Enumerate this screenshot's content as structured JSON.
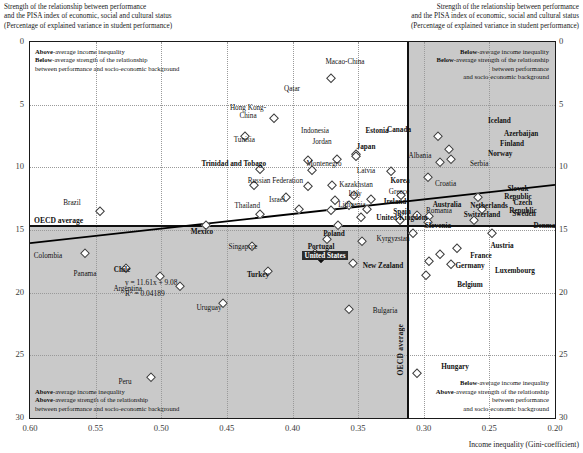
{
  "axis_titles": {
    "left": "Strength of the relationship between performance\nand the PISA index of economic, social and cultural status\n(Percentage of explained variance in student performance)",
    "right": "Strength of the relationship between performance\nand the PISA index of economic, social and cultural status\n(Percentage of explained variance in student performance)",
    "x": "Income inequality (Gini-coefficient)"
  },
  "notes": {
    "top_left": "Above-average income inequality\nBelow-average strength of the relationship\nbetween performance and socio-economic background",
    "bottom_left": "Above-average income inequality\nAbove-average strength of the relationship\nbetween performance and socio-economic background",
    "top_right": "Below-average income inequality\nBelow-average strength of the relationship\nbetween performance\nand socio-economic background",
    "bottom_right": "Below-average income inequality\nAbove-average strength of the relationship\nbetween performance\nand socio-economic background"
  },
  "oecd": {
    "horizontal_label": "OECD average",
    "vertical_label": "OECD average",
    "horizontal_value": 14.6,
    "vertical_value": 0.313
  },
  "regression": {
    "equation": "y = 11.61x + 9.08",
    "r2_label": "R",
    "r2_exp": "2",
    "r2_value": " = 0.04189",
    "slope": 11.61,
    "intercept": 9.08,
    "r2": 0.04189
  },
  "chart_data": {
    "type": "scatter",
    "title": "",
    "xlabel": "Income inequality (Gini-coefficient)",
    "ylabel": "Strength of the relationship between performance and the PISA index of economic, social and cultural status (Percentage of explained variance in student performance)",
    "xlim": [
      0.6,
      0.2
    ],
    "ylim": [
      0,
      30
    ],
    "x_reversed": true,
    "y_reversed": true,
    "xticks": [
      "0.60",
      "0.55",
      "0.50",
      "0.45",
      "0.40",
      "0.35",
      "0.30",
      "0.25",
      "0.20"
    ],
    "yticks": [
      "0",
      "5",
      "10",
      "15",
      "20",
      "25",
      "30"
    ],
    "grid": true,
    "legend": "none",
    "trendline": {
      "slope": 11.61,
      "intercept": 9.08,
      "r2": 0.04189
    },
    "points": [
      {
        "name": "Macao-China",
        "x": 0.371,
        "y": 2.9,
        "lx": 345,
        "ly": 58,
        "align": "c",
        "bold": false
      },
      {
        "name": "Qatar",
        "x": 0.414,
        "y": 6.1,
        "lx": 292,
        "ly": 85,
        "align": "c",
        "bold": false
      },
      {
        "name": "Hong Kong-\nChina",
        "x": 0.436,
        "y": 7.5,
        "lx": 248,
        "ly": 104,
        "align": "c",
        "bold": false
      },
      {
        "name": "Iceland",
        "x": 0.289,
        "y": 7.5,
        "lx": 488,
        "ly": 117,
        "align": "l",
        "bold": true
      },
      {
        "name": "Indonesia",
        "x": 0.388,
        "y": 9.4,
        "lx": 315,
        "ly": 127,
        "align": "c",
        "bold": false
      },
      {
        "name": "Estonia",
        "x": 0.366,
        "y": 9.3,
        "lx": 377,
        "ly": 127,
        "align": "c",
        "bold": true
      },
      {
        "name": "Tunisia",
        "x": 0.425,
        "y": 10.1,
        "lx": 255,
        "ly": 136,
        "align": "r",
        "bold": false
      },
      {
        "name": "Jordan",
        "x": 0.385,
        "y": 10.2,
        "lx": 322,
        "ly": 138,
        "align": "c",
        "bold": false
      },
      {
        "name": "Canada",
        "x": 0.352,
        "y": 8.9,
        "lx": 399,
        "ly": 126,
        "align": "c",
        "bold": true
      },
      {
        "name": "Japan",
        "x": 0.352,
        "y": 9.1,
        "lx": 366,
        "ly": 143,
        "align": "c",
        "bold": true
      },
      {
        "name": "Azerbaijan",
        "x": 0.281,
        "y": 8.5,
        "lx": 504,
        "ly": 130,
        "align": "l",
        "bold": true
      },
      {
        "name": "Finland",
        "x": 0.279,
        "y": 9.3,
        "lx": 500,
        "ly": 140,
        "align": "l",
        "bold": true
      },
      {
        "name": "Norway",
        "x": 0.288,
        "y": 9.6,
        "lx": 488,
        "ly": 150,
        "align": "l",
        "bold": true
      },
      {
        "name": "Albania",
        "x": 0.325,
        "y": 10.3,
        "lx": 420,
        "ly": 152,
        "align": "c",
        "bold": false
      },
      {
        "name": "Serbia",
        "x": 0.297,
        "y": 10.8,
        "lx": 470,
        "ly": 160,
        "align": "l",
        "bold": false
      },
      {
        "name": "Trinidad and Tobago",
        "x": 0.429,
        "y": 11.4,
        "lx": 266,
        "ly": 160,
        "align": "r",
        "bold": true
      },
      {
        "name": "Montenegro",
        "x": 0.388,
        "y": 11.5,
        "lx": 324,
        "ly": 160,
        "align": "c",
        "bold": false
      },
      {
        "name": "Latvia",
        "x": 0.37,
        "y": 11.4,
        "lx": 366,
        "ly": 167,
        "align": "c",
        "bold": false
      },
      {
        "name": "Russian Federation",
        "x": 0.405,
        "y": 12.4,
        "lx": 303,
        "ly": 177,
        "align": "r",
        "bold": false
      },
      {
        "name": "Kazakhstan",
        "x": 0.368,
        "y": 12.6,
        "lx": 356,
        "ly": 181,
        "align": "c",
        "bold": false
      },
      {
        "name": "Korea",
        "x": 0.353,
        "y": 12.2,
        "lx": 400,
        "ly": 177,
        "align": "c",
        "bold": true
      },
      {
        "name": "Croatia",
        "x": 0.317,
        "y": 12.2,
        "lx": 435,
        "ly": 180,
        "align": "l",
        "bold": false
      },
      {
        "name": "Greece",
        "x": 0.34,
        "y": 12.5,
        "lx": 399,
        "ly": 188,
        "align": "c",
        "bold": false
      },
      {
        "name": "Slovak Republic",
        "x": 0.259,
        "y": 12.4,
        "lx": 518,
        "ly": 185,
        "align": "c",
        "bold": true
      },
      {
        "name": "Italy",
        "x": 0.357,
        "y": 13.0,
        "lx": 355,
        "ly": 190,
        "align": "c",
        "bold": false
      },
      {
        "name": "Israel",
        "x": 0.395,
        "y": 13.3,
        "lx": 285,
        "ly": 196,
        "align": "r",
        "bold": false
      },
      {
        "name": "Lithuania",
        "x": 0.371,
        "y": 13.4,
        "lx": 352,
        "ly": 201,
        "align": "c",
        "bold": false
      },
      {
        "name": "Ireland",
        "x": 0.343,
        "y": 13.3,
        "lx": 395,
        "ly": 198,
        "align": "c",
        "bold": true
      },
      {
        "name": "Thailand",
        "x": 0.425,
        "y": 13.7,
        "lx": 260,
        "ly": 202,
        "align": "r",
        "bold": false
      },
      {
        "name": "Romania",
        "x": 0.318,
        "y": 14.2,
        "lx": 439,
        "ly": 207,
        "align": "c",
        "bold": false
      },
      {
        "name": "Spain",
        "x": 0.348,
        "y": 14.0,
        "lx": 402,
        "ly": 208,
        "align": "c",
        "bold": true
      },
      {
        "name": "Czech Republic",
        "x": 0.256,
        "y": 13.3,
        "lx": 523,
        "ly": 199,
        "align": "c",
        "bold": true
      },
      {
        "name": "Australia",
        "x": 0.305,
        "y": 13.8,
        "lx": 447,
        "ly": 201,
        "align": "c",
        "bold": true
      },
      {
        "name": "Netherlands",
        "x": 0.296,
        "y": 13.9,
        "lx": 489,
        "ly": 202,
        "align": "c",
        "bold": true
      },
      {
        "name": "Switzerland",
        "x": 0.297,
        "y": 14.4,
        "lx": 482,
        "ly": 211,
        "align": "c",
        "bold": true
      },
      {
        "name": "Sweden",
        "x": 0.262,
        "y": 14.2,
        "lx": 524,
        "ly": 210,
        "align": "c",
        "bold": true
      },
      {
        "name": "United Kingdom",
        "x": 0.365,
        "y": 14.6,
        "lx": 402,
        "ly": 214,
        "align": "c",
        "bold": true
      },
      {
        "name": "Brazil",
        "x": 0.547,
        "y": 13.5,
        "lx": 72,
        "ly": 199,
        "align": "c",
        "bold": false
      },
      {
        "name": "Slovenia",
        "x": 0.308,
        "y": 15.2,
        "lx": 438,
        "ly": 222,
        "align": "c",
        "bold": true
      },
      {
        "name": "Denmark",
        "x": 0.248,
        "y": 15.2,
        "lx": 548,
        "ly": 222,
        "align": "c",
        "bold": true
      },
      {
        "name": "Mexico",
        "x": 0.466,
        "y": 14.6,
        "lx": 202,
        "ly": 228,
        "align": "c",
        "bold": true
      },
      {
        "name": "Poland",
        "x": 0.374,
        "y": 15.7,
        "lx": 334,
        "ly": 230,
        "align": "c",
        "bold": true
      },
      {
        "name": "Kyrgyzstan",
        "x": 0.347,
        "y": 15.9,
        "lx": 393,
        "ly": 235,
        "align": "c",
        "bold": false
      },
      {
        "name": "Singapore",
        "x": 0.431,
        "y": 16.3,
        "lx": 243,
        "ly": 243,
        "align": "c",
        "bold": false
      },
      {
        "name": "Portugal",
        "x": 0.383,
        "y": 16.8,
        "lx": 321,
        "ly": 243,
        "align": "c",
        "bold": true
      },
      {
        "name": "Austria",
        "x": 0.275,
        "y": 16.4,
        "lx": 502,
        "ly": 242,
        "align": "c",
        "bold": true
      },
      {
        "name": "France",
        "x": 0.288,
        "y": 16.9,
        "lx": 481,
        "ly": 252,
        "align": "c",
        "bold": true
      },
      {
        "name": "United States",
        "x": 0.378,
        "y": 17.2,
        "lx": 325,
        "ly": 251,
        "align": "c",
        "bold": true,
        "highlight": true
      },
      {
        "name": "Colombia",
        "x": 0.558,
        "y": 16.8,
        "lx": 48,
        "ly": 252,
        "align": "c",
        "bold": false
      },
      {
        "name": "Germany",
        "x": 0.296,
        "y": 17.5,
        "lx": 470,
        "ly": 262,
        "align": "c",
        "bold": true
      },
      {
        "name": "New Zealand",
        "x": 0.354,
        "y": 17.6,
        "lx": 383,
        "ly": 262,
        "align": "c",
        "bold": true
      },
      {
        "name": "Luxembourg",
        "x": 0.279,
        "y": 17.7,
        "lx": 515,
        "ly": 267,
        "align": "c",
        "bold": true
      },
      {
        "name": "Panama",
        "x": 0.527,
        "y": 18.0,
        "lx": 85,
        "ly": 270,
        "align": "c",
        "bold": false
      },
      {
        "name": "Chile",
        "x": 0.501,
        "y": 18.7,
        "lx": 122,
        "ly": 266,
        "align": "c",
        "bold": true
      },
      {
        "name": "Belgium",
        "x": 0.298,
        "y": 18.6,
        "lx": 470,
        "ly": 281,
        "align": "c",
        "bold": true
      },
      {
        "name": "Turkey",
        "x": 0.419,
        "y": 18.3,
        "lx": 258,
        "ly": 271,
        "align": "c",
        "bold": true
      },
      {
        "name": "Argentina",
        "x": 0.486,
        "y": 19.5,
        "lx": 142,
        "ly": 285,
        "align": "r",
        "bold": false
      },
      {
        "name": "Uruguay",
        "x": 0.453,
        "y": 20.8,
        "lx": 209,
        "ly": 304,
        "align": "c",
        "bold": false
      },
      {
        "name": "Bulgaria",
        "x": 0.357,
        "y": 21.3,
        "lx": 385,
        "ly": 307,
        "align": "c",
        "bold": false
      },
      {
        "name": "Hungary",
        "x": 0.305,
        "y": 26.4,
        "lx": 455,
        "ly": 363,
        "align": "c",
        "bold": true
      },
      {
        "name": "Peru",
        "x": 0.508,
        "y": 26.7,
        "lx": 125,
        "ly": 378,
        "align": "c",
        "bold": false
      }
    ]
  }
}
